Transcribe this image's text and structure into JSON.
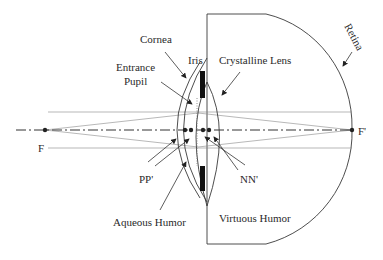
{
  "diagram": {
    "labels": {
      "cornea": "Cornea",
      "iris": "Iris",
      "crystalline_lens": "Crystalline Lens",
      "entrance_pupil_line1": "Entrance",
      "entrance_pupil_line2": "Pupil",
      "retina": "Retina",
      "focal_front": "F",
      "focal_back": "F'",
      "principal_points": "PP'",
      "nodal_points": "NN'",
      "aqueous_humor": "Aqueous Humor",
      "vitreous_humor": "Virtuous Humor"
    },
    "colors": {
      "line": "#3a3a3a",
      "ray": "#888888",
      "iris": "#111111",
      "background": "#ffffff"
    }
  }
}
